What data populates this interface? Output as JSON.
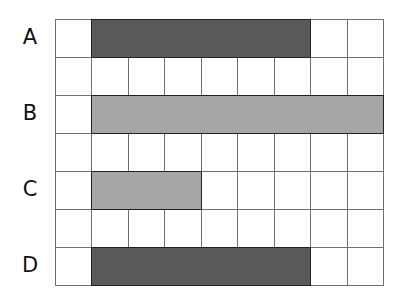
{
  "grid": {
    "columns": 9,
    "rows": 7,
    "left": 55,
    "top": 19,
    "width": 328,
    "height": 266
  },
  "colors": {
    "dark": "#595959",
    "light": "#a6a6a6",
    "line": "#707070"
  },
  "rows": [
    {
      "label": "A",
      "row": 0,
      "start_col": 1,
      "span": 6,
      "shade": "dark"
    },
    {
      "label": "B",
      "row": 2,
      "start_col": 1,
      "span": 8,
      "shade": "light"
    },
    {
      "label": "C",
      "row": 4,
      "start_col": 1,
      "span": 3,
      "shade": "light"
    },
    {
      "label": "D",
      "row": 6,
      "start_col": 1,
      "span": 6,
      "shade": "dark"
    }
  ]
}
